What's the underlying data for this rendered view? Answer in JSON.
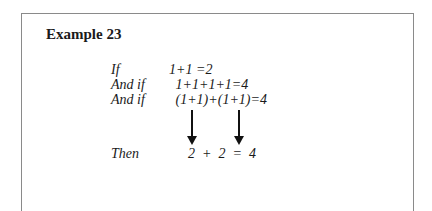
{
  "title": "Example 23",
  "rows": [
    {
      "label": "If",
      "expr": "1+1 =2"
    },
    {
      "label": "And if",
      "expr": " 1+1+1+1=4"
    },
    {
      "label": "And if",
      "expr": " (1+1)+(1+1)=4"
    },
    {
      "label": "Then",
      "expr": "  2  +  2  =  4"
    }
  ]
}
